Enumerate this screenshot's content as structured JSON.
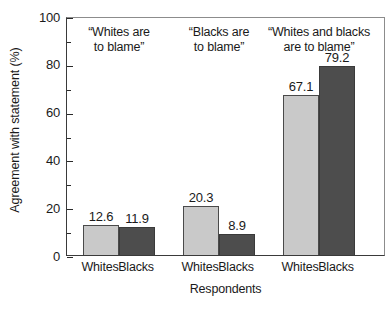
{
  "chart_data": {
    "type": "bar",
    "title": "",
    "xlabel": "Respondents",
    "ylabel": "Agreement with statement (%)",
    "ylim": [
      0,
      100
    ],
    "ytick_major": [
      0,
      20,
      40,
      60,
      80,
      100
    ],
    "ytick_minor": [
      10,
      30,
      50,
      70,
      90
    ],
    "grid": false,
    "legend": "none",
    "categories": [
      "Whites",
      "Blacks"
    ],
    "groups": [
      {
        "annotation": "“Whites are\nto blame”",
        "bars": [
          {
            "category": "Whites",
            "value": 12.6,
            "label": "12.6",
            "shade": "light"
          },
          {
            "category": "Blacks",
            "value": 11.9,
            "label": "11.9",
            "shade": "dark"
          }
        ]
      },
      {
        "annotation": "“Blacks are\nto blame”",
        "bars": [
          {
            "category": "Whites",
            "value": 20.3,
            "label": "20.3",
            "shade": "light"
          },
          {
            "category": "Blacks",
            "value": 8.9,
            "label": "8.9",
            "shade": "dark"
          }
        ]
      },
      {
        "annotation": "“Whites and blacks\nare to blame”",
        "bars": [
          {
            "category": "Whites",
            "value": 67.1,
            "label": "67.1",
            "shade": "light"
          },
          {
            "category": "Blacks",
            "value": 79.2,
            "label": "79.2",
            "shade": "dark"
          }
        ]
      }
    ],
    "colors": {
      "light_bar": "#c9c9c9",
      "dark_bar": "#4d4d4d",
      "bar_outline": "#3a3a3a",
      "axis": "#2a2a2a",
      "frame": "#8c8c8c",
      "text": "#1a1a1a",
      "background": "#ffffff"
    }
  },
  "axis": {
    "y_tick_labels": [
      "0",
      "20",
      "40",
      "60",
      "80",
      "100"
    ],
    "y_title": "Agreement with statement (%)",
    "x_title": "Respondents"
  }
}
